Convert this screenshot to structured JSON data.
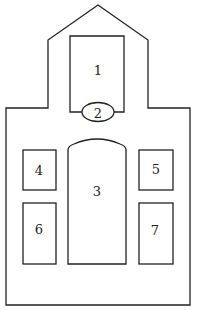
{
  "diagram": {
    "type": "floor-plan",
    "outline": "church-shaped building with gabled tower",
    "colors": {
      "stroke": "#222222",
      "background": "#ffffff"
    },
    "compartments": [
      {
        "id": "1",
        "label": "1",
        "shape": "rectangle",
        "position": "tower"
      },
      {
        "id": "2",
        "label": "2",
        "shape": "ellipse",
        "position": "base of tower"
      },
      {
        "id": "3",
        "label": "3",
        "shape": "arched-rectangle",
        "position": "center of body"
      },
      {
        "id": "4",
        "label": "4",
        "shape": "rectangle",
        "position": "upper left"
      },
      {
        "id": "5",
        "label": "5",
        "shape": "rectangle",
        "position": "upper right"
      },
      {
        "id": "6",
        "label": "6",
        "shape": "rectangle",
        "position": "lower left"
      },
      {
        "id": "7",
        "label": "7",
        "shape": "rectangle",
        "position": "lower right"
      }
    ]
  }
}
